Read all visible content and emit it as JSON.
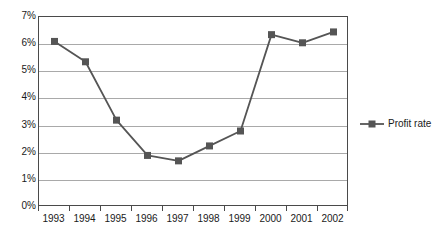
{
  "chart_data": {
    "type": "line",
    "title": "",
    "xlabel": "",
    "ylabel": "",
    "categories": [
      "1993",
      "1994",
      "1995",
      "1996",
      "1997",
      "1998",
      "1999",
      "2000",
      "2001",
      "2002"
    ],
    "series": [
      {
        "name": "Profit rate",
        "values": [
          6.1,
          5.35,
          3.2,
          1.9,
          1.7,
          2.25,
          2.8,
          6.35,
          6.05,
          6.45
        ],
        "color": "#555555",
        "marker": "square"
      }
    ],
    "ylim": [
      0,
      7
    ],
    "ytick_values": [
      0,
      1,
      2,
      3,
      4,
      5,
      6,
      7
    ],
    "ytick_labels": [
      "0%",
      "1%",
      "2%",
      "3%",
      "4%",
      "5%",
      "6%",
      "7%"
    ],
    "grid": true,
    "grid_color": "#a9a9a9",
    "plot_border_color": "#4a4a4a",
    "legend_position": "right"
  },
  "legend": {
    "entries": [
      {
        "label": "Profit rate",
        "color": "#555555"
      }
    ]
  }
}
